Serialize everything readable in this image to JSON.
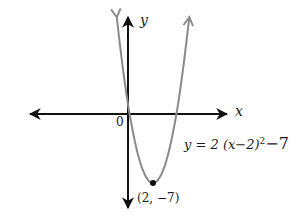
{
  "chart_data": {
    "type": "line",
    "title": "",
    "xlabel": "x",
    "ylabel": "y",
    "origin_label": "0",
    "function": "y = 2(x-2)^2 - 7",
    "equation_label": {
      "lhs": "y = 2 (x−2)",
      "exp": "2",
      "rhs": "−7"
    },
    "vertex": {
      "x": 2,
      "y": -7,
      "label": "(2, −7)"
    },
    "x_intercepts_approx": [
      0.13,
      3.87
    ],
    "y_intercept": 1,
    "xlim": [
      -8,
      8
    ],
    "ylim": [
      -10,
      10
    ],
    "grid": false,
    "axis_color": "#111111",
    "curve_color": "#8a8a8a",
    "series": [
      {
        "name": "y = 2(x-2)^2 - 7",
        "x": [
          -0.9,
          -0.5,
          0,
          0.5,
          1,
          1.5,
          2,
          2.5,
          3,
          3.5,
          4,
          4.5,
          4.9
        ],
        "y": [
          9.82,
          5.5,
          1,
          -2.5,
          -5,
          -6.5,
          -7,
          -6.5,
          -5,
          -2.5,
          1,
          5.5,
          9.82
        ]
      }
    ]
  }
}
